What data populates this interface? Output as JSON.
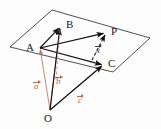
{
  "figure": {
    "background_color": "#fdfdfd",
    "colors": {
      "plane_edge": "#3d3d3d",
      "solid_vector": "#111111",
      "dashed_black": "#1a1a1a",
      "red_vector": "#c2705c",
      "red_dashed": "#c98a78",
      "label_text": "#1a1a1a"
    },
    "plane": {
      "name": "parallelogram-plane",
      "points": "10,47 52,10 150,38 113,72"
    },
    "points": [
      {
        "id": "A",
        "label": "A",
        "x": 40,
        "y": 48,
        "label_x": 26,
        "label_y": 42
      },
      {
        "id": "B",
        "label": "B",
        "x": 60,
        "y": 27,
        "label_x": 66,
        "label_y": 19
      },
      {
        "id": "C",
        "label": "C",
        "x": 103,
        "y": 65,
        "label_x": 108,
        "label_y": 58
      },
      {
        "id": "P",
        "label": "P",
        "x": 105,
        "y": 33,
        "label_x": 111,
        "label_y": 26
      },
      {
        "id": "O",
        "label": "O",
        "x": 50,
        "y": 110,
        "label_x": 44,
        "label_y": 113
      }
    ],
    "solid_vectors": [
      {
        "name": "vector-A-to-B",
        "from": "A",
        "to": "B",
        "x1": 40,
        "y1": 48,
        "x2": 60,
        "y2": 27
      },
      {
        "name": "vector-A-to-P",
        "from": "A",
        "to": "P",
        "x1": 40,
        "y1": 48,
        "x2": 105,
        "y2": 33
      },
      {
        "name": "vector-A-to-C",
        "from": "A",
        "to": "C",
        "x1": 40,
        "y1": 48,
        "x2": 103,
        "y2": 65
      },
      {
        "name": "vector-O-to-B",
        "from": "O",
        "to": "B",
        "x1": 50,
        "y1": 110,
        "x2": 60,
        "y2": 27
      },
      {
        "name": "vector-O-to-C",
        "from": "O",
        "to": "C",
        "x1": 50,
        "y1": 110,
        "x2": 103,
        "y2": 65
      }
    ],
    "red_vectors": [
      {
        "name": "vector-O-to-A",
        "from": "O",
        "to": "A",
        "x1": 50,
        "y1": 110,
        "x2": 40,
        "y2": 48
      },
      {
        "name": "vector-O-to-B-red",
        "from": "O",
        "to": "B",
        "x1": 50,
        "y1": 110,
        "x2": 60,
        "y2": 27
      },
      {
        "name": "vector-O-to-C-red",
        "from": "O",
        "to": "C",
        "x1": 50,
        "y1": 110,
        "x2": 103,
        "y2": 65
      }
    ],
    "dashed_lines": [
      {
        "name": "dashed-line-B-vertical",
        "color": "red",
        "x1": 60,
        "y1": 30,
        "x2": 56,
        "y2": 80
      },
      {
        "name": "dashed-arrow-C-to-P",
        "color": "black",
        "x1": 92,
        "y1": 60,
        "x2": 105,
        "y2": 35
      }
    ],
    "vector_labels": [
      {
        "id": "a",
        "text": "a",
        "color": "red",
        "x": 34,
        "y": 80,
        "name": "vector-label-a"
      },
      {
        "id": "b",
        "text": "b",
        "color": "red",
        "x": 56,
        "y": 75,
        "name": "vector-label-b"
      },
      {
        "id": "c",
        "text": "c",
        "color": "red",
        "x": 78,
        "y": 94,
        "name": "vector-label-c"
      },
      {
        "id": "x",
        "text": "x",
        "color": "dark",
        "x": 96,
        "y": 44,
        "name": "vector-label-x"
      }
    ]
  }
}
